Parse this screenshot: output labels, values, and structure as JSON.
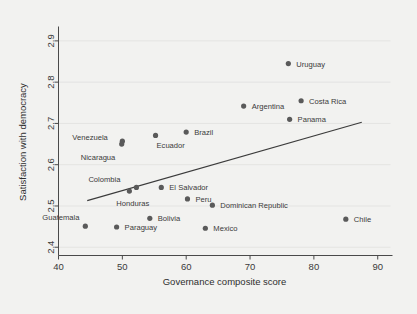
{
  "chart_data": {
    "type": "scatter",
    "title": "",
    "xlabel": "Governance composite score",
    "ylabel": "Satisfaction with democracy",
    "xlim": [
      40,
      92
    ],
    "ylim": [
      2.38,
      2.93
    ],
    "xticks": [
      40,
      50,
      60,
      70,
      80,
      90
    ],
    "yticks": [
      2.4,
      2.5,
      2.6,
      2.7,
      2.8,
      2.9
    ],
    "xtick_labels": [
      "40",
      "50",
      "60",
      "70",
      "80",
      "90"
    ],
    "ytick_labels": [
      "2.4",
      "2.5",
      "2.6",
      "2.7",
      "2.8",
      "2.9"
    ],
    "grid": true,
    "legend": "none",
    "points": [
      {
        "label": "Uruguay",
        "x": 76.0,
        "y": 2.845,
        "lx": 8,
        "ly": 3
      },
      {
        "label": "Costa Rica",
        "x": 78.0,
        "y": 2.755,
        "lx": 8,
        "ly": 3
      },
      {
        "label": "Argentina",
        "x": 69.0,
        "y": 2.742,
        "lx": 8,
        "ly": 3
      },
      {
        "label": "Panama",
        "x": 76.2,
        "y": 2.71,
        "lx": 8,
        "ly": 3
      },
      {
        "label": "Brazil",
        "x": 60.0,
        "y": 2.679,
        "lx": 8,
        "ly": 3
      },
      {
        "label": "Ecuador",
        "x": 55.2,
        "y": 2.671,
        "lx": 1,
        "ly": 13
      },
      {
        "label": "Venezuela",
        "x": 50.0,
        "y": 2.657,
        "lx": -50,
        "ly": -1
      },
      {
        "label": "Nicaragua",
        "x": 49.9,
        "y": 2.65,
        "lx": -41,
        "ly": 16
      },
      {
        "label": "El Salvador",
        "x": 56.1,
        "y": 2.545,
        "lx": 8,
        "ly": 3
      },
      {
        "label": "Colombia",
        "x": 52.2,
        "y": 2.545,
        "lx": -48,
        "ly": -5
      },
      {
        "label": "Honduras",
        "x": 51.1,
        "y": 2.536,
        "lx": -13,
        "ly": 15
      },
      {
        "label": "Peru",
        "x": 60.2,
        "y": 2.517,
        "lx": 8,
        "ly": 3
      },
      {
        "label": "Dominican Republic",
        "x": 64.1,
        "y": 2.502,
        "lx": 8,
        "ly": 3
      },
      {
        "label": "Bolivia",
        "x": 54.3,
        "y": 2.47,
        "lx": 8,
        "ly": 3
      },
      {
        "label": "Chile",
        "x": 85.0,
        "y": 2.468,
        "lx": 8,
        "ly": 3
      },
      {
        "label": "Guatemala",
        "x": 44.2,
        "y": 2.451,
        "lx": -43,
        "ly": -6
      },
      {
        "label": "Paraguay",
        "x": 49.1,
        "y": 2.449,
        "lx": 8,
        "ly": 3
      },
      {
        "label": "Mexico",
        "x": 63.0,
        "y": 2.446,
        "lx": 8,
        "ly": 3
      }
    ],
    "trend_line": {
      "x1": 44.5,
      "y1": 2.513,
      "x2": 87.5,
      "y2": 2.703
    }
  }
}
